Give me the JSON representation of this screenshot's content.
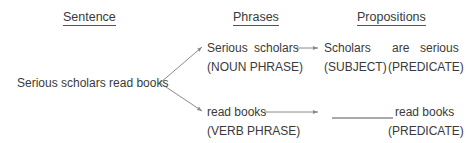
{
  "headers": {
    "sentence": "Sentence",
    "phrases": "Phrases",
    "propositions": "Propositions"
  },
  "sentence": "Serious scholars read books",
  "phrases": [
    {
      "text_1": "Serious",
      "text_2": "scholars",
      "label": "(NOUN PHRASE)"
    },
    {
      "text": "read books",
      "label": "(VERB PHRASE)"
    }
  ],
  "propositions": [
    {
      "subject": "Scholars",
      "subject_label": "(SUBJECT)",
      "predicate": "are serious",
      "predicate_1": "are",
      "predicate_2": "serious",
      "predicate_label": "(PREDICATE)"
    },
    {
      "blank": "__________",
      "predicate": "read books",
      "predicate_label": "(PREDICATE)"
    }
  ],
  "colors": {
    "text": "#3a3a3a",
    "arrow": "#8a8a8a"
  }
}
